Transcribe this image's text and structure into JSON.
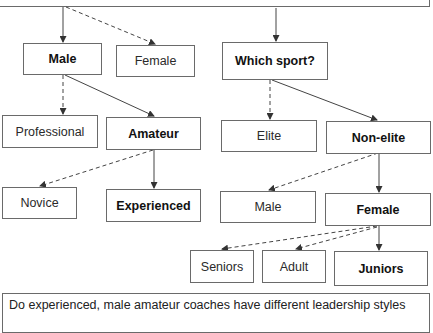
{
  "diagram": {
    "type": "decision-tree",
    "nodes": {
      "male": {
        "label": "Male",
        "selected": true
      },
      "female": {
        "label": "Female",
        "selected": false
      },
      "which_sport": {
        "label": "Which sport?",
        "selected": true
      },
      "professional": {
        "label": "Professional",
        "selected": false
      },
      "amateur": {
        "label": "Amateur",
        "selected": true
      },
      "elite": {
        "label": "Elite",
        "selected": false
      },
      "non_elite": {
        "label": "Non-elite",
        "selected": true
      },
      "novice": {
        "label": "Novice",
        "selected": false
      },
      "experienced": {
        "label": "Experienced",
        "selected": true
      },
      "male2": {
        "label": "Male",
        "selected": false
      },
      "female2": {
        "label": "Female",
        "selected": true
      },
      "seniors": {
        "label": "Seniors",
        "selected": false
      },
      "adult": {
        "label": "Adult",
        "selected": false
      },
      "juniors": {
        "label": "Juniors",
        "selected": true
      }
    },
    "edges": [
      {
        "from": "top",
        "to": "male",
        "style": "solid"
      },
      {
        "from": "top",
        "to": "female",
        "style": "dashed"
      },
      {
        "from": "top",
        "to": "which_sport",
        "style": "solid"
      },
      {
        "from": "male",
        "to": "professional",
        "style": "dashed"
      },
      {
        "from": "male",
        "to": "amateur",
        "style": "solid"
      },
      {
        "from": "which_sport",
        "to": "elite",
        "style": "dashed"
      },
      {
        "from": "which_sport",
        "to": "non_elite",
        "style": "solid"
      },
      {
        "from": "amateur",
        "to": "novice",
        "style": "dashed"
      },
      {
        "from": "amateur",
        "to": "experienced",
        "style": "solid"
      },
      {
        "from": "non_elite",
        "to": "male2",
        "style": "dashed"
      },
      {
        "from": "non_elite",
        "to": "female2",
        "style": "solid"
      },
      {
        "from": "female2",
        "to": "seniors",
        "style": "dashed"
      },
      {
        "from": "female2",
        "to": "adult",
        "style": "dashed"
      },
      {
        "from": "female2",
        "to": "juniors",
        "style": "solid"
      }
    ],
    "question": "Do experienced, male amateur coaches have different leadership styles"
  }
}
